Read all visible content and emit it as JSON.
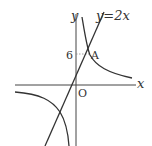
{
  "diagram": {
    "type": "function-graph",
    "axes": {
      "x_label": "x",
      "y_label": "y",
      "origin_label": "O"
    },
    "line": {
      "equation_label": "y=2x",
      "slope": 2
    },
    "hyperbola": {
      "form": "y=k/x",
      "k": 18
    },
    "point": {
      "label": "A",
      "y_value": 6,
      "y_tick_label": "6"
    },
    "colors": {
      "stroke": "#333333",
      "guide": "#888888",
      "background": "#ffffff"
    }
  }
}
